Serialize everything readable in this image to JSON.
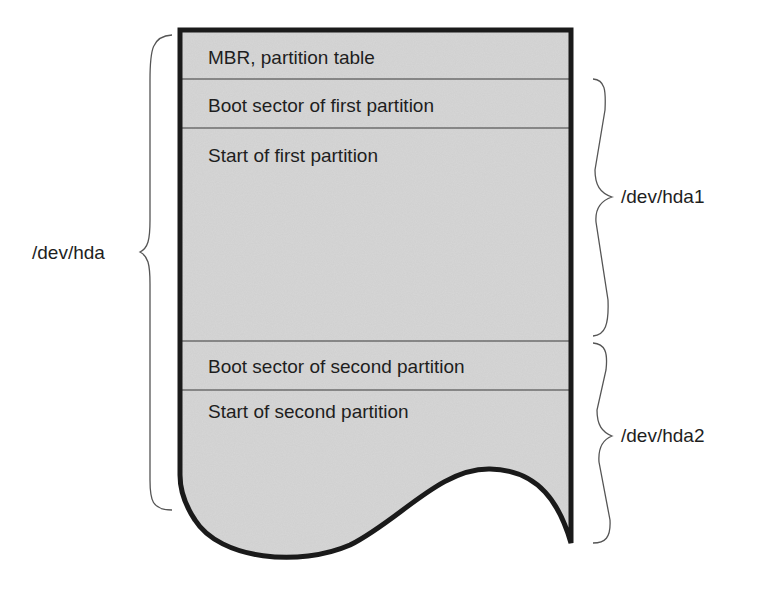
{
  "diagram": {
    "colors": {
      "fill": "#cfcfcf",
      "stroke": "#1a1a1a",
      "text": "#1e1e1e",
      "divider": "#3a3a3a"
    },
    "sections": [
      {
        "label": "MBR, partition table"
      },
      {
        "label": "Boot sector of first partition"
      },
      {
        "label": "Start of first partition"
      },
      {
        "label": "Boot sector of second partition"
      },
      {
        "label": "Start of second partition"
      }
    ],
    "braces": {
      "disk": {
        "label": "/dev/hda",
        "side": "left"
      },
      "partition1": {
        "label": "/dev/hda1",
        "side": "right"
      },
      "partition2": {
        "label": "/dev/hda2",
        "side": "right"
      }
    }
  }
}
